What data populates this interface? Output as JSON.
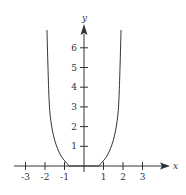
{
  "chart_data": {
    "type": "line",
    "title": "",
    "xlabel": "x",
    "ylabel": "y",
    "xlim": [
      -3.3,
      4.5
    ],
    "ylim": [
      0,
      7.1
    ],
    "x_ticks": [
      -3,
      -2,
      -1,
      1,
      2,
      3
    ],
    "x_tick_labels": [
      "-3",
      "-2",
      "-1",
      "1",
      "2",
      "3"
    ],
    "y_ticks": [
      1,
      2,
      3,
      4,
      5,
      6
    ],
    "y_tick_labels": [
      "1",
      "2",
      "3",
      "4",
      "5",
      "6"
    ],
    "grid": false,
    "legend": null,
    "series": [
      {
        "name": "f(x)",
        "color": "#333333",
        "x": [
          -1.9,
          -1.8,
          -1.7,
          -1.5,
          -1.2,
          -0.8,
          -0.7,
          0,
          0.7,
          0.8,
          1.2,
          1.5,
          1.7,
          1.8,
          1.9
        ],
        "y": [
          6.9,
          3.6,
          2.3,
          1.3,
          0.55,
          0.05,
          0,
          0,
          0,
          0.05,
          0.55,
          1.3,
          2.3,
          3.6,
          6.9
        ]
      }
    ]
  },
  "colors": {
    "ink": "#333333",
    "background": "#ffffff"
  }
}
